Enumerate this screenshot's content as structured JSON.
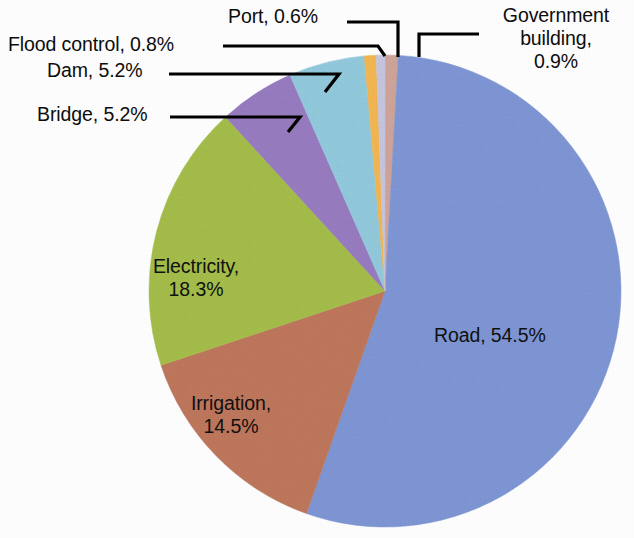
{
  "chart_data": {
    "type": "pie",
    "title": "",
    "subtitle": "",
    "xlabel": "",
    "ylabel": "",
    "legend_position": "none",
    "grid": false,
    "label_format": "{name}, {value}%",
    "start_angle_deg": 0,
    "direction": "clockwise",
    "categories": [
      "Government building",
      "Road",
      "Irrigation",
      "Electricity",
      "Bridge",
      "Dam",
      "Flood control",
      "Port"
    ],
    "values": [
      0.9,
      54.5,
      14.5,
      18.3,
      5.2,
      5.2,
      0.8,
      0.6
    ],
    "colors": [
      "#d3a79c",
      "#8199d9",
      "#c2795e",
      "#a7c14b",
      "#9a7ec4",
      "#94cde0",
      "#f7ba52",
      "#c9c9e4"
    ],
    "slices": [
      {
        "name": "Government building",
        "value": 0.9,
        "color": "#d3a79c",
        "label": "Government building, 0.9%",
        "label_placement": "outside"
      },
      {
        "name": "Road",
        "value": 54.5,
        "color": "#8199d9",
        "label": "Road, 54.5%",
        "label_placement": "inside"
      },
      {
        "name": "Irrigation",
        "value": 14.5,
        "color": "#c2795e",
        "label": "Irrigation, 14.5%",
        "label_placement": "inside"
      },
      {
        "name": "Electricity",
        "value": 18.3,
        "color": "#a7c14b",
        "label": "Electricity, 18.3%",
        "label_placement": "inside"
      },
      {
        "name": "Bridge",
        "value": 5.2,
        "color": "#9a7ec4",
        "label": "Bridge, 5.2%",
        "label_placement": "outside"
      },
      {
        "name": "Dam",
        "value": 5.2,
        "color": "#94cde0",
        "label": "Dam, 5.2%",
        "label_placement": "outside"
      },
      {
        "name": "Flood control",
        "value": 0.8,
        "color": "#f7ba52",
        "label": "Flood control, 0.8%",
        "label_placement": "outside"
      },
      {
        "name": "Port",
        "value": 0.6,
        "color": "#c9c9e4",
        "label": "Port, 0.6%",
        "label_placement": "outside"
      }
    ],
    "total": 100.0
  },
  "labels": {
    "flood_control": "Flood control, 0.8%",
    "dam": "Dam, 5.2%",
    "bridge": "Bridge, 5.2%",
    "port": "Port, 0.6%",
    "government_building_line1": "Government",
    "government_building_line2": "building,",
    "government_building_line3": "0.9%",
    "electricity_line1": "Electricity,",
    "electricity_line2": "18.3%",
    "irrigation_line1": "Irrigation,",
    "irrigation_line2": "14.5%",
    "road": "Road, 54.5%"
  }
}
